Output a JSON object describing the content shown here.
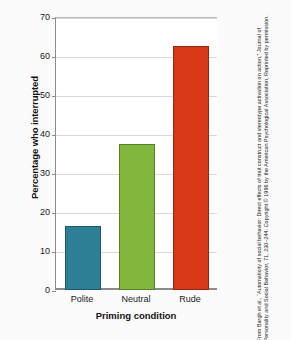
{
  "chart_data": {
    "type": "bar",
    "title": "",
    "categories": [
      "Polite",
      "Neutral",
      "Rude"
    ],
    "values": [
      16.5,
      37.5,
      62.5
    ],
    "xlabel": "Priming condition",
    "ylabel": "Percentage who interrupted",
    "ylim": [
      0,
      70
    ],
    "yticks": [
      0,
      10,
      20,
      30,
      40,
      50,
      60,
      70
    ],
    "ytick_labels": [
      "0",
      "10",
      "20",
      "30",
      "40",
      "50",
      "60",
      "70"
    ],
    "grid": true,
    "legend": "none",
    "bar_colors": [
      "#2d7f95",
      "#82b73e",
      "#d8371a"
    ]
  },
  "axis": {
    "y_title": "Percentage who interrupted",
    "x_title": "Priming condition"
  },
  "credit": {
    "text": "From Bargh et al., “Automaticity of social behavior: Direct effects of trait construct and stereotype activation on action,” Journal of Personality and Social Behavior, 71, 230–244. Copyright © 1996 by the American Psychological Association. Reprinted by permission."
  },
  "colors": {
    "polite": "#2d7f95",
    "neutral": "#82b73e",
    "rude": "#d8371a",
    "grid": "#d9d9d9",
    "axis": "#8c8c8c"
  }
}
